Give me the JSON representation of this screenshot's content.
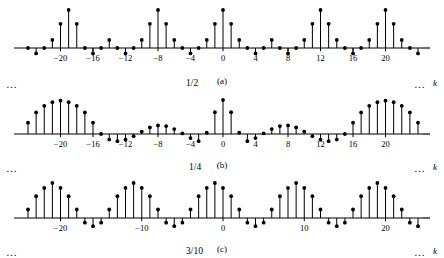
{
  "figure": {
    "axis_variable_label": "k",
    "ellipsis": "…",
    "panels": [
      {
        "id": "a",
        "caption": "(a)",
        "amplitude_label": "1/2",
        "amplitude_value": 0.5,
        "tick_labels": [
          "−20",
          "−16",
          "−12",
          "−8",
          "−4",
          "0",
          "4",
          "8",
          "12",
          "16",
          "20"
        ],
        "tick_values": [
          -20,
          -16,
          -12,
          -8,
          -4,
          0,
          4,
          8,
          12,
          16,
          20
        ]
      },
      {
        "id": "b",
        "caption": "(b)",
        "amplitude_label": "1/4",
        "amplitude_value": 0.25,
        "tick_labels": [
          "−20",
          "−16",
          "−12",
          "−8",
          "−4",
          "0",
          "4",
          "8",
          "12",
          "16",
          "20"
        ],
        "tick_values": [
          -20,
          -16,
          -12,
          -8,
          -4,
          0,
          4,
          8,
          12,
          16,
          20
        ]
      },
      {
        "id": "c",
        "caption": "(c)",
        "amplitude_label": "3/10",
        "amplitude_value": 0.3,
        "tick_labels": [
          "−20",
          "−10",
          "0",
          "10",
          "20"
        ],
        "tick_values": [
          -20,
          -10,
          0,
          10,
          20
        ]
      }
    ]
  },
  "chart_data": [
    {
      "type": "stem",
      "panel": "a",
      "title": "",
      "annotation": "1/2",
      "xlabel": "k",
      "ylabel": "",
      "period": 8,
      "xlim": [
        -25,
        25
      ],
      "ylim": [
        -0.12,
        0.55
      ],
      "grid": false,
      "legend": null,
      "tick_values": [
        -20,
        -16,
        -12,
        -8,
        -4,
        0,
        4,
        8,
        12,
        16,
        20
      ],
      "x": [
        -24,
        -23,
        -22,
        -21,
        -20,
        -19,
        -18,
        -17,
        -16,
        -15,
        -14,
        -13,
        -12,
        -11,
        -10,
        -9,
        -8,
        -7,
        -6,
        -5,
        -4,
        -3,
        -2,
        -1,
        0,
        1,
        2,
        3,
        4,
        5,
        6,
        7,
        8,
        9,
        10,
        11,
        12,
        13,
        14,
        15,
        16,
        17,
        18,
        19,
        20,
        21,
        22,
        23,
        24
      ],
      "values": [
        0.0,
        -0.071,
        0.0,
        0.106,
        0.318,
        0.5,
        0.318,
        0.0,
        -0.071,
        0.0,
        0.106,
        0.0,
        -0.071,
        0.0,
        0.106,
        0.318,
        0.5,
        0.318,
        0.106,
        0.0,
        -0.071,
        0.0,
        0.106,
        0.318,
        0.5,
        0.318,
        0.106,
        0.0,
        -0.071,
        0.0,
        0.106,
        0.0,
        -0.071,
        0.0,
        0.106,
        0.318,
        0.5,
        0.318,
        0.106,
        0.0,
        -0.071,
        0.0,
        0.106,
        0.318,
        0.5,
        0.318,
        0.106,
        0.0,
        -0.071
      ]
    },
    {
      "type": "stem",
      "panel": "b",
      "title": "",
      "annotation": "1/4",
      "xlabel": "k",
      "ylabel": "",
      "period": 16,
      "xlim": [
        -25,
        25
      ],
      "ylim": [
        -0.08,
        0.3
      ],
      "grid": false,
      "legend": false,
      "tick_values": [
        -20,
        -16,
        -12,
        -8,
        -4,
        0,
        4,
        8,
        12,
        16,
        20
      ],
      "x": [
        -24,
        -23,
        -22,
        -21,
        -20,
        -19,
        -18,
        -17,
        -16,
        -15,
        -14,
        -13,
        -12,
        -11,
        -10,
        -9,
        -8,
        -7,
        -6,
        -5,
        -4,
        -3,
        -2,
        -1,
        0,
        1,
        2,
        3,
        4,
        5,
        6,
        7,
        8,
        9,
        10,
        11,
        12,
        13,
        14,
        15,
        16,
        17,
        18,
        19,
        20,
        21,
        22,
        23,
        24
      ],
      "values": [
        0.083,
        0.159,
        0.207,
        0.234,
        0.245,
        0.234,
        0.207,
        0.159,
        0.083,
        0.0,
        -0.041,
        -0.053,
        -0.042,
        -0.016,
        0.018,
        0.048,
        0.063,
        0.058,
        0.036,
        0.004,
        -0.03,
        -0.053,
        0.01,
        0.16,
        0.25,
        0.16,
        0.01,
        -0.053,
        -0.03,
        0.004,
        0.036,
        0.058,
        0.063,
        0.048,
        0.018,
        -0.016,
        -0.042,
        -0.053,
        -0.041,
        0.0,
        0.083,
        0.159,
        0.207,
        0.234,
        0.245,
        0.234,
        0.207,
        0.159,
        0.083
      ]
    },
    {
      "type": "stem",
      "panel": "c",
      "title": "",
      "annotation": "3/10",
      "xlabel": "k",
      "ylabel": "",
      "period": 10,
      "xlim": [
        -25,
        25
      ],
      "ylim": [
        -0.1,
        0.33
      ],
      "grid": false,
      "legend": false,
      "tick_values": [
        -20,
        -10,
        0,
        10,
        20
      ],
      "x": [
        -24,
        -23,
        -22,
        -21,
        -20,
        -19,
        -18,
        -17,
        -16,
        -15,
        -14,
        -13,
        -12,
        -11,
        -10,
        -9,
        -8,
        -7,
        -6,
        -5,
        -4,
        -3,
        -2,
        -1,
        0,
        1,
        2,
        3,
        4,
        5,
        6,
        7,
        8,
        9,
        10,
        11,
        12,
        13,
        14,
        15,
        16,
        17,
        18,
        19,
        20,
        21,
        22,
        23,
        24
      ],
      "values": [
        0.073,
        0.187,
        0.258,
        0.3,
        0.258,
        0.187,
        0.073,
        -0.04,
        -0.07,
        -0.04,
        0.073,
        0.187,
        0.258,
        0.3,
        0.258,
        0.187,
        0.073,
        -0.04,
        -0.07,
        -0.04,
        0.073,
        0.187,
        0.258,
        0.3,
        0.258,
        0.187,
        0.073,
        -0.04,
        -0.07,
        -0.04,
        0.073,
        0.187,
        0.258,
        0.3,
        0.258,
        0.187,
        0.073,
        -0.04,
        -0.07,
        -0.04,
        0.073,
        0.187,
        0.258,
        0.3,
        0.258,
        0.187,
        0.073,
        -0.04,
        -0.07
      ]
    }
  ]
}
